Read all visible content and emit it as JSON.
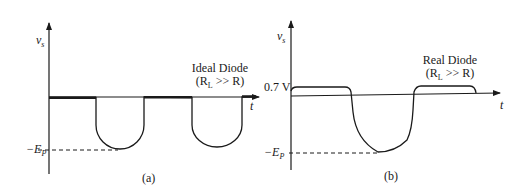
{
  "panel_a": {
    "y_label": "v",
    "y_label_sub": "s",
    "x_label": "t",
    "title_line1": "Ideal Diode",
    "title_line2": "(R",
    "title_line2_sub": "L",
    "title_line2_rest": " >> R)",
    "neg_peak_label": "−E",
    "neg_peak_sub": "P",
    "caption": "(a)"
  },
  "panel_b": {
    "y_label": "v",
    "y_label_sub": "s",
    "x_label": "t",
    "title_line1": "Real Diode",
    "title_line2": "(R",
    "title_line2_sub": "L",
    "title_line2_rest": " >> R)",
    "forward_voltage_label": "0.7 V",
    "neg_peak_label": "−E",
    "neg_peak_sub": "P",
    "caption": "(b)"
  },
  "colors": {
    "ink": "#1a1a1a",
    "background": "#ffffff"
  }
}
